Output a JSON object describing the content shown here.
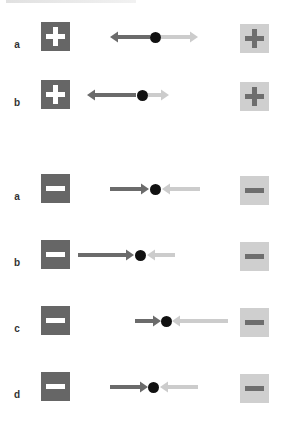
{
  "figure": {
    "colors": {
      "dark_box": "#666666",
      "light_box": "#cfcfcf",
      "dark_arrow": "#6b6b6b",
      "light_arrow": "#cccccc",
      "dot": "#111111"
    },
    "groups": [
      {
        "sign": "plus",
        "rows": [
          {
            "label": "a",
            "y": 37,
            "left_arrow": {
              "from": 150,
              "to": 110,
              "direction": "left"
            },
            "dot_x": 155,
            "right_arrow": {
              "from": 161,
              "to": 198,
              "direction": "right"
            }
          },
          {
            "label": "b",
            "y": 95,
            "left_arrow": {
              "from": 136,
              "to": 87,
              "direction": "left"
            },
            "dot_x": 142,
            "right_arrow": {
              "from": 148,
              "to": 169,
              "direction": "right"
            }
          }
        ]
      },
      {
        "sign": "minus",
        "rows": [
          {
            "label": "a",
            "y": 189,
            "left_arrow": {
              "from": 110,
              "to": 149,
              "direction": "right"
            },
            "dot_x": 155,
            "right_arrow": {
              "from": 200,
              "to": 162,
              "direction": "left"
            }
          },
          {
            "label": "b",
            "y": 255,
            "left_arrow": {
              "from": 78,
              "to": 134,
              "direction": "right"
            },
            "dot_x": 140,
            "right_arrow": {
              "from": 175,
              "to": 147,
              "direction": "left"
            }
          },
          {
            "label": "c",
            "y": 321,
            "left_arrow": {
              "from": 135,
              "to": 161,
              "direction": "right"
            },
            "dot_x": 166,
            "right_arrow": {
              "from": 228,
              "to": 172,
              "direction": "left"
            }
          },
          {
            "label": "d",
            "y": 387,
            "left_arrow": {
              "from": 110,
              "to": 148,
              "direction": "right"
            },
            "dot_x": 153,
            "right_arrow": {
              "from": 198,
              "to": 160,
              "direction": "left"
            }
          }
        ]
      }
    ]
  }
}
